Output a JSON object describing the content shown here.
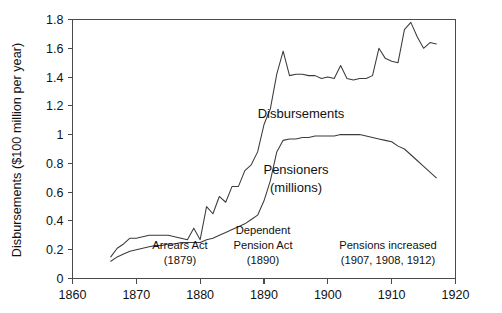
{
  "chart_data": {
    "type": "line",
    "title": "",
    "xlabel": "",
    "ylabel": "Disbursements ($100 million per year)",
    "xlim": [
      1860,
      1920
    ],
    "ylim": [
      0,
      1.8
    ],
    "xticks": [
      1860,
      1870,
      1880,
      1890,
      1900,
      1910,
      1920
    ],
    "xtick_labels": [
      "1860",
      "1870",
      "1880",
      "1890",
      "1900",
      "1910",
      "1920"
    ],
    "yticks": [
      0,
      0.2,
      0.4,
      0.6,
      0.8,
      1,
      1.2,
      1.4,
      1.6,
      1.8
    ],
    "ytick_labels": [
      "0",
      "0.2",
      "0.4",
      "0.6",
      "0.8",
      "1",
      "1.2",
      "1.4",
      "1.6",
      "1.8"
    ],
    "grid": false,
    "legend_position": "inline-labels",
    "series": [
      {
        "name": "Disbursements",
        "label": "Disbursements",
        "color": "#3b3b3b",
        "x": [
          1866,
          1867,
          1868,
          1869,
          1870,
          1871,
          1872,
          1873,
          1874,
          1875,
          1876,
          1877,
          1878,
          1879,
          1880,
          1881,
          1882,
          1883,
          1884,
          1885,
          1886,
          1887,
          1888,
          1889,
          1890,
          1891,
          1892,
          1893,
          1894,
          1895,
          1896,
          1897,
          1898,
          1899,
          1900,
          1901,
          1902,
          1903,
          1904,
          1905,
          1906,
          1907,
          1908,
          1909,
          1910,
          1911,
          1912,
          1913,
          1914,
          1915,
          1916,
          1917
        ],
        "values": [
          0.15,
          0.21,
          0.24,
          0.28,
          0.28,
          0.29,
          0.3,
          0.3,
          0.3,
          0.3,
          0.29,
          0.28,
          0.27,
          0.35,
          0.27,
          0.5,
          0.45,
          0.57,
          0.53,
          0.64,
          0.64,
          0.75,
          0.79,
          0.88,
          1.07,
          1.18,
          1.42,
          1.58,
          1.41,
          1.42,
          1.42,
          1.41,
          1.41,
          1.39,
          1.4,
          1.39,
          1.48,
          1.39,
          1.38,
          1.39,
          1.39,
          1.41,
          1.6,
          1.53,
          1.51,
          1.5,
          1.73,
          1.78,
          1.68,
          1.6,
          1.64,
          1.63
        ]
      },
      {
        "name": "Pensioners",
        "label": "Pensioners",
        "label_unit": "(millions)",
        "color": "#3b3b3b",
        "x": [
          1866,
          1867,
          1868,
          1869,
          1870,
          1871,
          1872,
          1873,
          1874,
          1875,
          1876,
          1877,
          1878,
          1879,
          1880,
          1881,
          1882,
          1883,
          1884,
          1885,
          1886,
          1887,
          1888,
          1889,
          1890,
          1891,
          1892,
          1893,
          1894,
          1895,
          1896,
          1897,
          1898,
          1899,
          1900,
          1901,
          1902,
          1903,
          1904,
          1905,
          1906,
          1907,
          1908,
          1909,
          1910,
          1911,
          1912,
          1913,
          1914,
          1915,
          1916,
          1917
        ],
        "values": [
          0.12,
          0.15,
          0.17,
          0.19,
          0.2,
          0.21,
          0.22,
          0.23,
          0.23,
          0.24,
          0.24,
          0.25,
          0.25,
          0.25,
          0.25,
          0.27,
          0.28,
          0.3,
          0.32,
          0.34,
          0.36,
          0.38,
          0.41,
          0.44,
          0.54,
          0.68,
          0.88,
          0.96,
          0.97,
          0.97,
          0.98,
          0.98,
          0.99,
          0.99,
          0.99,
          0.99,
          1.0,
          1.0,
          1.0,
          1.0,
          0.99,
          0.98,
          0.97,
          0.96,
          0.95,
          0.92,
          0.9,
          0.86,
          0.82,
          0.78,
          0.74,
          0.7
        ]
      }
    ],
    "annotations": [
      {
        "id": "arrears-act",
        "line1": "Arrears Act",
        "line2": "(1879)",
        "x": 1878,
        "y": 0.17
      },
      {
        "id": "dependent-pension-act",
        "line1": "Dependent",
        "line2": "Pension Act",
        "line3": "(1890)",
        "x": 1890,
        "y": 0.25
      },
      {
        "id": "pensions-increased",
        "line1": "Pensions increased",
        "line2": "(1907, 1908, 1912)",
        "x": 1908,
        "y": 0.17
      }
    ]
  }
}
